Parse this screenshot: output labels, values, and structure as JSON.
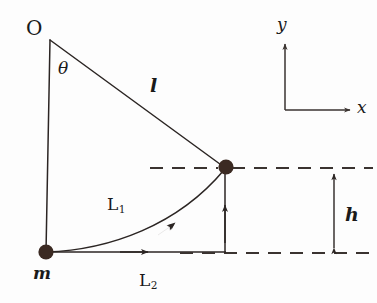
{
  "figure": {
    "type": "physics-diagram",
    "background_color": "#fdfdfd",
    "stroke_color": "#2b2523",
    "dash_color": "#3a3330",
    "dot_color": "#3b2a22"
  },
  "labels": {
    "pivot": "O",
    "angle": "θ",
    "string_length": "l",
    "mass": "m",
    "path_curved": "L",
    "path_curved_sub": "1",
    "path_straight": "L",
    "path_straight_sub": "2",
    "height": "h",
    "axis_x": "x",
    "axis_y": "y"
  },
  "geometry": {
    "pivot_point": [
      50,
      40
    ],
    "bob_point": [
      225,
      168
    ],
    "mass_point": [
      46,
      252
    ],
    "string_length_px": 217,
    "height_px": 84,
    "axes_origin": [
      285,
      110
    ],
    "axis_x_tip": [
      352,
      110
    ],
    "axis_y_tip": [
      285,
      40
    ],
    "dim_arrow_x": 334,
    "dim_arrow_top": 170,
    "dim_arrow_bottom": 253
  },
  "label_positions": {
    "pivot": [
      30,
      22
    ],
    "angle": [
      58,
      62
    ],
    "string_length": [
      148,
      78
    ],
    "mass": [
      34,
      266
    ],
    "path_curved": [
      106,
      196
    ],
    "path_straight": [
      138,
      272
    ],
    "height": [
      344,
      208
    ],
    "axis_x": [
      358,
      98
    ],
    "axis_y": [
      277,
      14
    ]
  }
}
